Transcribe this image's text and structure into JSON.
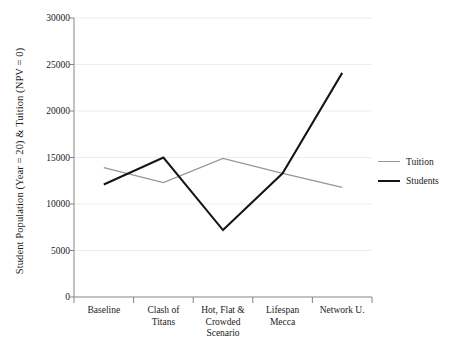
{
  "chart_data": {
    "type": "line",
    "title": "",
    "xlabel": "Scenario",
    "ylabel": "Student Population (Year = 20) & Tuition (NPV = 0)",
    "categories": [
      "Baseline",
      "Clash of Titans",
      "Hot, Flat & Crowded",
      "Lifespan Mecca",
      "Network U."
    ],
    "category_lines": [
      [
        "Baseline"
      ],
      [
        "Clash of",
        "Titans"
      ],
      [
        "Hot, Flat &",
        "Crowded"
      ],
      [
        "Lifespan",
        "Mecca"
      ],
      [
        "Network U."
      ]
    ],
    "series": [
      {
        "name": "Tuition",
        "color": "#969696",
        "width": 1.3,
        "values": [
          13900,
          12300,
          14900,
          13300,
          11800
        ]
      },
      {
        "name": "Students",
        "color": "#141414",
        "width": 2.0,
        "values": [
          12100,
          15000,
          7200,
          13300,
          24100
        ]
      }
    ],
    "ylim": [
      0,
      30000
    ],
    "yticks": [
      0,
      5000,
      10000,
      15000,
      20000,
      25000,
      30000
    ],
    "ytick_labels": [
      "0",
      "5000",
      "10000",
      "15000",
      "20000",
      "25000",
      "30000"
    ],
    "grid": "horizontal",
    "grid_color": "#eeeeee",
    "axis_color": "#808080",
    "legend_position": "right",
    "legend_entries": [
      "Tuition",
      "Students"
    ]
  }
}
